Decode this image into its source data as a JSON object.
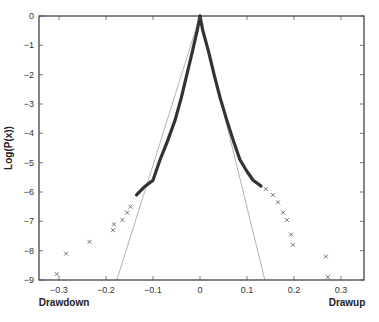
{
  "chart_data": {
    "type": "scatter",
    "title": "",
    "xlabel_left": "Drawdown",
    "xlabel_right": "Drawup",
    "ylabel": "Log(P(x))",
    "xlim": [
      -0.34,
      0.35
    ],
    "ylim": [
      -9,
      0
    ],
    "x_ticks": [
      -0.3,
      -0.2,
      -0.1,
      0,
      0.1,
      0.2,
      0.3
    ],
    "x_tick_labels": [
      "−0.3",
      "−0.2",
      "−0.1",
      "0",
      "0.1",
      "0.2",
      "0.3"
    ],
    "y_ticks": [
      0,
      -1,
      -2,
      -3,
      -4,
      -5,
      -6,
      -7,
      -8,
      -9
    ],
    "y_tick_labels": [
      "0",
      "−1",
      "−2",
      "−3",
      "−4",
      "−5",
      "−6",
      "−7",
      "−8",
      "−9"
    ],
    "grid": false,
    "legend": null,
    "series": [
      {
        "name": "empirical distribution (dense)",
        "marker": "x",
        "color": "#333333",
        "points": [
          [
            -0.135,
            -6.1
          ],
          [
            -0.12,
            -5.85
          ],
          [
            -0.1,
            -5.6
          ],
          [
            -0.085,
            -4.9
          ],
          [
            -0.07,
            -4.3
          ],
          [
            -0.053,
            -3.55
          ],
          [
            -0.04,
            -2.8
          ],
          [
            -0.028,
            -2.0
          ],
          [
            -0.016,
            -1.2
          ],
          [
            -0.006,
            -0.5
          ],
          [
            0,
            0
          ],
          [
            0.006,
            -0.5
          ],
          [
            0.018,
            -1.2
          ],
          [
            0.03,
            -2.0
          ],
          [
            0.043,
            -2.8
          ],
          [
            0.057,
            -3.55
          ],
          [
            0.072,
            -4.3
          ],
          [
            0.085,
            -4.9
          ],
          [
            0.1,
            -5.3
          ],
          [
            0.113,
            -5.6
          ],
          [
            0.13,
            -5.8
          ]
        ]
      },
      {
        "name": "drawdown outliers",
        "marker": "x",
        "color": "#555555",
        "points": [
          [
            -0.305,
            -8.8
          ],
          [
            -0.285,
            -8.1
          ],
          [
            -0.235,
            -7.7
          ],
          [
            -0.185,
            -7.3
          ],
          [
            -0.183,
            -7.1
          ],
          [
            -0.165,
            -6.95
          ],
          [
            -0.155,
            -6.7
          ],
          [
            -0.148,
            -6.5
          ]
        ]
      },
      {
        "name": "drawup outliers",
        "marker": "x",
        "color": "#555555",
        "points": [
          [
            0.14,
            -5.9
          ],
          [
            0.155,
            -6.1
          ],
          [
            0.166,
            -6.35
          ],
          [
            0.177,
            -6.7
          ],
          [
            0.185,
            -6.95
          ],
          [
            0.194,
            -7.45
          ],
          [
            0.198,
            -7.8
          ],
          [
            0.268,
            -8.2
          ],
          [
            0.272,
            -8.9
          ]
        ]
      },
      {
        "name": "exponential fit (drawdown)",
        "type": "line",
        "color": "#aaaaaa",
        "points": [
          [
            0,
            0
          ],
          [
            -0.177,
            -9
          ]
        ]
      },
      {
        "name": "exponential fit (drawup)",
        "type": "line",
        "color": "#aaaaaa",
        "points": [
          [
            0,
            0
          ],
          [
            0.138,
            -9
          ]
        ]
      }
    ]
  }
}
